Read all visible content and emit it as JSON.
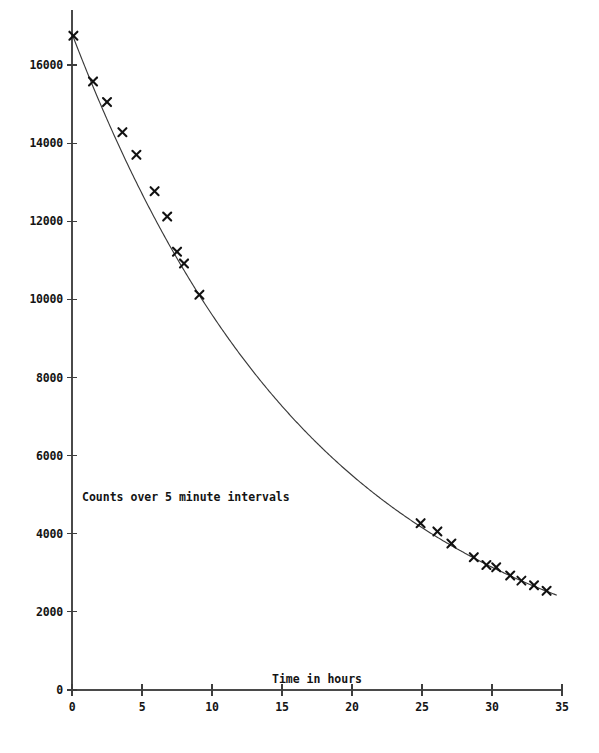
{
  "chart_data": {
    "type": "scatter",
    "title": "",
    "subtitle": "",
    "xlabel": "Time in hours",
    "ylabel": "",
    "inner_label": "Counts over 5 minute intervals",
    "xlim": [
      0,
      35
    ],
    "ylim": [
      0,
      17400
    ],
    "x_ticks": [
      0,
      5,
      10,
      15,
      20,
      25,
      30,
      35
    ],
    "x_tick_labels": [
      "0",
      "5",
      "10",
      "15",
      "20",
      "25",
      "30",
      "35"
    ],
    "y_ticks": [
      0,
      2000,
      4000,
      6000,
      8000,
      10000,
      12000,
      14000,
      16000
    ],
    "y_tick_labels": [
      "0",
      "2000",
      "4000",
      "6000",
      "8000",
      "10000",
      "12000",
      "14000",
      "16000"
    ],
    "grid": false,
    "legend": false,
    "marker_style": "x",
    "series": [
      {
        "name": "Counts over 5 minute intervals",
        "marker": "x",
        "points": [
          {
            "x": 0.1,
            "y": 16750
          },
          {
            "x": 1.5,
            "y": 15580
          },
          {
            "x": 2.5,
            "y": 15050
          },
          {
            "x": 3.6,
            "y": 14280
          },
          {
            "x": 4.6,
            "y": 13700
          },
          {
            "x": 5.9,
            "y": 12770
          },
          {
            "x": 6.8,
            "y": 12120
          },
          {
            "x": 7.5,
            "y": 11220
          },
          {
            "x": 8.0,
            "y": 10920
          },
          {
            "x": 9.1,
            "y": 10120
          },
          {
            "x": 24.9,
            "y": 4270
          },
          {
            "x": 26.1,
            "y": 4060
          },
          {
            "x": 27.1,
            "y": 3750
          },
          {
            "x": 28.7,
            "y": 3400
          },
          {
            "x": 29.6,
            "y": 3200
          },
          {
            "x": 30.3,
            "y": 3140
          },
          {
            "x": 31.3,
            "y": 2930
          },
          {
            "x": 32.1,
            "y": 2800
          },
          {
            "x": 33.0,
            "y": 2680
          },
          {
            "x": 33.9,
            "y": 2540
          }
        ]
      }
    ],
    "fit_curve": {
      "name": "exponential-decay-fit",
      "model": "y = A * exp(-t / tau)",
      "A": 16800,
      "tau": 17.9,
      "t_start": 0.0,
      "t_end": 34.6
    }
  },
  "axes": {
    "x_axis_name": "time-axis",
    "y_axis_name": "counts-axis"
  }
}
